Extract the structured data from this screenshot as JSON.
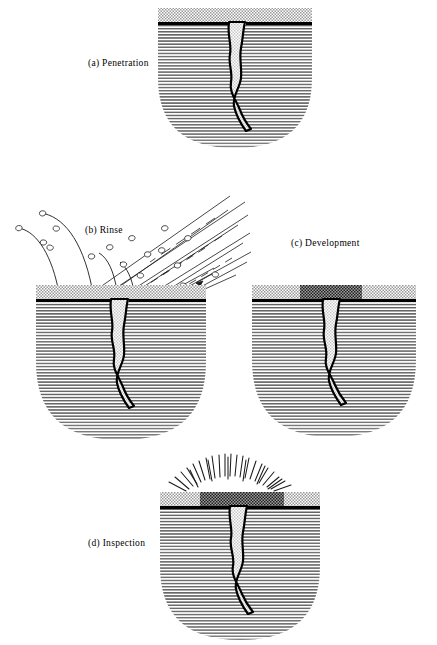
{
  "figure": {
    "background_color": "#ffffff",
    "ink_color": "#000000",
    "caption_partial": ""
  },
  "panels": [
    {
      "id": "penetration",
      "key": "a",
      "label": "(a)  Penetration",
      "label_x": 88,
      "label_y": 58,
      "body_x": 158,
      "body_y": 8,
      "body_w": 154,
      "body_h": 140,
      "surface_layer": "uniform-penetrant-film",
      "has_dark_indication_band": false,
      "has_spray": false,
      "has_rays": false
    },
    {
      "id": "rinse",
      "key": "b",
      "label": "(b)  Rinse",
      "label_x": 85,
      "label_y": 225,
      "body_x": 36,
      "body_y": 285,
      "body_w": 170,
      "body_h": 155,
      "surface_layer": "thin-residual-film",
      "has_dark_indication_band": false,
      "has_spray": true,
      "has_rays": false
    },
    {
      "id": "development",
      "key": "c",
      "label": "(c)  Development",
      "label_x": 291,
      "label_y": 238,
      "body_x": 252,
      "body_y": 285,
      "body_w": 164,
      "body_h": 152,
      "surface_layer": "developer-coating",
      "has_dark_indication_band": true,
      "has_spray": false,
      "has_rays": false
    },
    {
      "id": "inspection",
      "key": "d",
      "label": "(d)  Inspection",
      "label_x": 88,
      "label_y": 538,
      "body_x": 160,
      "body_y": 492,
      "body_w": 160,
      "body_h": 148,
      "surface_layer": "developer-coating",
      "has_dark_indication_band": true,
      "has_spray": false,
      "has_rays": true
    }
  ],
  "styling": {
    "surface_line_color": "#000000",
    "crack_outline_color": "#000000",
    "crack_fill": "light-stipple",
    "body_fill": "horizontal-hatch-gradient",
    "penetrant_film_fill": "light-checker-stipple",
    "indication_band_fill": "dark-checker-stipple",
    "spray_line_color": "#1a1a1a",
    "droplet_outline_color": "#1a1a1a",
    "ray_color": "#1a1a1a"
  },
  "counts": {
    "spray_lines": 11,
    "spray_droplets": 16,
    "splash_arcs": 4,
    "inspection_rays": 27
  }
}
